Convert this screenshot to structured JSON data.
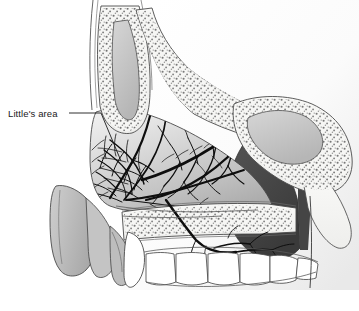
{
  "figure": {
    "kind": "medical-illustration",
    "background_color": "#ffffff"
  },
  "labels": [
    {
      "id": "littles-area",
      "text": "Little's area",
      "leader": {
        "from_x": 69,
        "from_y": 113,
        "to_x": 120,
        "to_y": 160
      }
    }
  ],
  "annotation": {
    "littles_area_label": "Little's area"
  },
  "palette": {
    "outline": "#3a3a3a",
    "vessel": "#111111",
    "bone_fill": "#f4f4f2",
    "bone_stipple": "#6e6e6e",
    "mucosa_light": "#dcdcdc",
    "mucosa_mid": "#bdbdbd",
    "mucosa_dark": "#9a9a9a",
    "cavity_dark": "#4a4a4a",
    "cavity_darker": "#3c3c3c",
    "sinus_fill": "#c9c9c9",
    "teeth_fill": "#ffffff",
    "label_color": "#1a1a1a",
    "background": "#ffffff"
  },
  "regions": [
    {
      "name": "frontal-sinus",
      "fill": "#c9c9c9"
    },
    {
      "name": "sphenoid-sinus",
      "fill": "#c9c9c9"
    },
    {
      "name": "nasal-septum-mucosa",
      "fill": "#d2d2d2"
    },
    {
      "name": "nasopharynx-cavity",
      "fill": "#4a4a4a"
    },
    {
      "name": "hard-palate-bone",
      "fill": "#f2f2f0"
    },
    {
      "name": "upper-teeth",
      "fill": "#ffffff"
    },
    {
      "name": "columella-nose-tip",
      "fill": "#bdbdbd"
    },
    {
      "name": "cribriform-plate",
      "fill": "#f4f4f2"
    }
  ],
  "vascular": {
    "plexus_name": "kiesselbach-plexus",
    "description": "anastomotic arterial network of the anteroinferior nasal septum"
  }
}
